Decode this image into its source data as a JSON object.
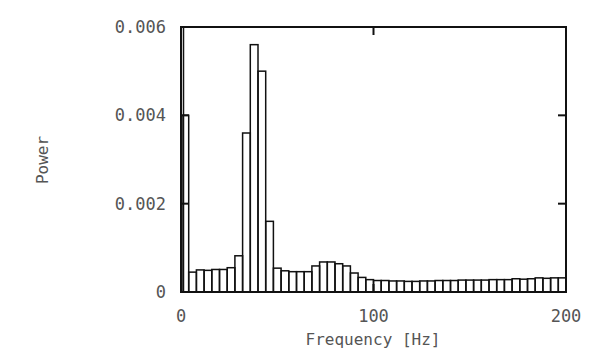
{
  "chart_data": {
    "type": "bar",
    "title": "",
    "xlabel": "Frequency [Hz]",
    "ylabel": "Power",
    "xlim": [
      0,
      200
    ],
    "ylim": [
      0,
      0.006
    ],
    "grid": false,
    "legend": null,
    "bin_width_hz": 4,
    "xticks": [
      0,
      100,
      200
    ],
    "xtick_labels": [
      "0",
      "100",
      "200"
    ],
    "yticks": [
      0,
      0.002,
      0.004,
      0.006
    ],
    "ytick_labels": [
      "0",
      "0.002",
      "0.004",
      "0.006"
    ],
    "annotations": [
      "DC spike at 0 Hz exceeds plot top (clipped)"
    ],
    "dc_spike": {
      "x": 0,
      "value": 0.0065,
      "clipped": true
    },
    "x": [
      2,
      6,
      10,
      14,
      18,
      22,
      26,
      30,
      34,
      38,
      42,
      46,
      50,
      54,
      58,
      62,
      66,
      70,
      74,
      78,
      82,
      86,
      90,
      94,
      98,
      102,
      106,
      110,
      114,
      118,
      122,
      126,
      130,
      134,
      138,
      142,
      146,
      150,
      154,
      158,
      162,
      166,
      170,
      174,
      178,
      182,
      186,
      190,
      194,
      198
    ],
    "values": [
      0.004,
      0.00045,
      0.0005,
      0.00049,
      0.00051,
      0.00051,
      0.00055,
      0.00082,
      0.0036,
      0.0056,
      0.005,
      0.0016,
      0.00054,
      0.00048,
      0.00046,
      0.00046,
      0.00046,
      0.00059,
      0.00068,
      0.00068,
      0.00064,
      0.00059,
      0.00043,
      0.00033,
      0.00028,
      0.00026,
      0.00026,
      0.00025,
      0.00025,
      0.00024,
      0.00024,
      0.00025,
      0.00025,
      0.00026,
      0.00026,
      0.00026,
      0.00027,
      0.00027,
      0.00027,
      0.00027,
      0.00028,
      0.00028,
      0.00028,
      0.0003,
      0.00029,
      0.0003,
      0.00032,
      0.00031,
      0.00032,
      0.00032
    ]
  },
  "style": {
    "line_color": "#111111",
    "text_color": "#555555",
    "background": "#ffffff"
  }
}
